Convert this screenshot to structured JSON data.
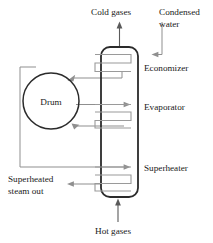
{
  "diagram": {
    "labels": {
      "cold_gases": "Cold gases",
      "condensed_water_line1": "Condensed",
      "condensed_water_line2": "water",
      "economizer": "Economizer",
      "evaporator": "Evaporator",
      "superheater": "Superheater",
      "drum": "Drum",
      "superheated_steam_line1": "Superheated",
      "superheated_steam_line2": "steam out",
      "hot_gases": "Hot gases"
    },
    "colors": {
      "background": "#ffffff",
      "duct_outline": "#2b2b2b",
      "drum_outline": "#2b2b2b",
      "coil": "#9a9a9a",
      "flow_line": "#8f8f8f",
      "flow_line_dark": "#5a5a5a",
      "text": "#1a1a1a"
    },
    "sections": [
      {
        "name": "economizer",
        "label": "Economizer",
        "order": 1,
        "position": "top"
      },
      {
        "name": "evaporator",
        "label": "Evaporator",
        "order": 2,
        "position": "middle"
      },
      {
        "name": "superheater",
        "label": "Superheater",
        "order": 3,
        "position": "bottom"
      }
    ],
    "streams": [
      {
        "name": "cold-gases-out",
        "label": "Cold gases",
        "direction": "up",
        "location": "duct-top"
      },
      {
        "name": "condensed-water-in",
        "label": "Condensed water",
        "direction": "down",
        "location": "economizer-inlet"
      },
      {
        "name": "superheated-steam-out",
        "label": "Superheated steam out",
        "direction": "left",
        "location": "superheater-outlet"
      },
      {
        "name": "hot-gases-in",
        "label": "Hot gases",
        "direction": "up",
        "location": "duct-bottom"
      }
    ]
  }
}
